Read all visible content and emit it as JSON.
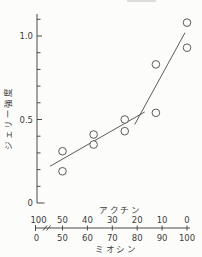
{
  "figure": {
    "background": "#fcfcfa",
    "ink_color": "#4a4a4a"
  },
  "chart_data": {
    "type": "scatter",
    "title": "",
    "ylabel": "ジェリー強度",
    "legend": "none",
    "grid": false,
    "y_axis": {
      "range": [
        0,
        1.13
      ],
      "minor_tick_step": 0.1,
      "labeled_ticks": [
        {
          "value": 0,
          "label": "0"
        },
        {
          "value": 0.5,
          "label": "0.5"
        },
        {
          "value": 1.0,
          "label": "1.0"
        }
      ]
    },
    "x_top": {
      "label": "アクチン"
    },
    "x_bottom": {
      "label": "ミオシン",
      "axis_break_between": [
        "0",
        "50"
      ]
    },
    "x_pairs": [
      {
        "actin": "100",
        "myosin": "0"
      },
      {
        "actin": "50",
        "myosin": "50"
      },
      {
        "actin": "40",
        "myosin": "60"
      },
      {
        "actin": "30",
        "myosin": "70"
      },
      {
        "actin": "20",
        "myosin": "80"
      },
      {
        "actin": "10",
        "myosin": "90"
      },
      {
        "actin": "0",
        "myosin": "100"
      }
    ],
    "series": [
      {
        "name": "jelly-strength-points",
        "marker": "open-circle",
        "points": [
          {
            "myosin": 50,
            "actin": 50,
            "strength": 0.19
          },
          {
            "myosin": 50,
            "actin": 50,
            "strength": 0.31
          },
          {
            "myosin": 62.5,
            "actin": 37.5,
            "strength": 0.35
          },
          {
            "myosin": 62.5,
            "actin": 37.5,
            "strength": 0.41
          },
          {
            "myosin": 75,
            "actin": 25,
            "strength": 0.43
          },
          {
            "myosin": 75,
            "actin": 25,
            "strength": 0.5
          },
          {
            "myosin": 87.5,
            "actin": 12.5,
            "strength": 0.54
          },
          {
            "myosin": 87.5,
            "actin": 12.5,
            "strength": 0.83
          },
          {
            "myosin": 100,
            "actin": 0,
            "strength": 0.93
          },
          {
            "myosin": 100,
            "actin": 0,
            "strength": 1.08
          }
        ]
      }
    ],
    "trend_lines": [
      {
        "name": "lower-slope-segment",
        "from": {
          "myosin": 45,
          "strength": 0.22
        },
        "to": {
          "myosin": 83,
          "strength": 0.545
        }
      },
      {
        "name": "upper-slope-segment",
        "from": {
          "myosin": 79,
          "strength": 0.47
        },
        "to": {
          "myosin": 99.2,
          "strength": 1.02
        }
      }
    ]
  }
}
